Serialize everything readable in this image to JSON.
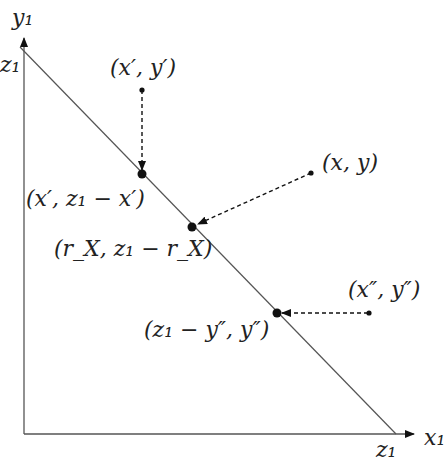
{
  "diagram": {
    "type": "projection-onto-simplex",
    "axes": {
      "x_label": "x₁",
      "y_label": "y₁",
      "x_intercept_label": "z₁",
      "y_intercept_label": "z₁"
    },
    "points": [
      {
        "name": "x-prime-source",
        "label": "(x′, y′)"
      },
      {
        "name": "x-prime-projection",
        "label": "(x′, z₁ − x′)"
      },
      {
        "name": "xy-source",
        "label": "(x, y)"
      },
      {
        "name": "xy-projection",
        "label": "(r_X, z₁ − r_X)"
      },
      {
        "name": "x-double-prime-source",
        "label": "(x″, y″)"
      },
      {
        "name": "x-double-prime-projection",
        "label": "(z₁ − y″, y″)"
      }
    ],
    "colors": {
      "line": "#555555",
      "ink": "#111111",
      "background": "#ffffff"
    }
  }
}
